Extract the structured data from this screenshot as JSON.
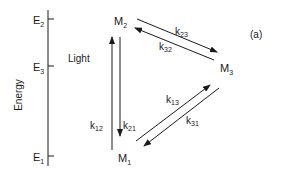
{
  "figure": {
    "panel_label": "(a)",
    "axis_label": "Energy",
    "levels": [
      {
        "id": "E2",
        "label": "E",
        "sub": "2"
      },
      {
        "id": "E3",
        "label": "E",
        "sub": "3"
      },
      {
        "id": "E1",
        "label": "E",
        "sub": "1"
      }
    ],
    "states": [
      {
        "id": "M2",
        "label": "M",
        "sub": "2"
      },
      {
        "id": "M3",
        "label": "M",
        "sub": "3"
      },
      {
        "id": "M1",
        "label": "M",
        "sub": "1"
      }
    ],
    "excitation_label": "Light",
    "rates": [
      {
        "id": "k12",
        "label": "k",
        "sub": "12"
      },
      {
        "id": "k21",
        "label": "k",
        "sub": "21"
      },
      {
        "id": "k23",
        "label": "k",
        "sub": "23"
      },
      {
        "id": "k32",
        "label": "k",
        "sub": "32"
      },
      {
        "id": "k13",
        "label": "k",
        "sub": "13"
      },
      {
        "id": "k31",
        "label": "k",
        "sub": "31"
      }
    ]
  }
}
